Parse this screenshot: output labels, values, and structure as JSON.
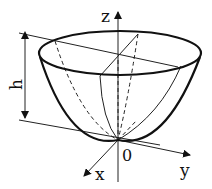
{
  "figure": {
    "labels": {
      "z_axis": "z",
      "y_axis": "y",
      "x_axis": "x",
      "origin": "0",
      "height": "h"
    },
    "colors": {
      "stroke": "#111111",
      "background": "#ffffff"
    }
  }
}
